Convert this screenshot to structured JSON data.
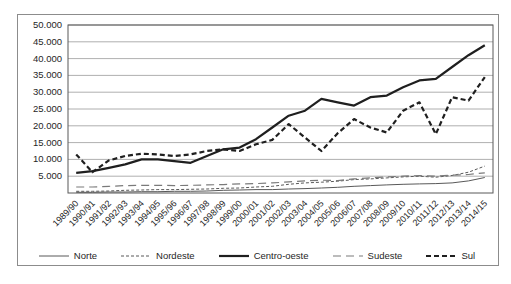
{
  "chart_data": {
    "type": "line",
    "title": "",
    "xlabel": "",
    "ylabel": "",
    "ylim": [
      0,
      50
    ],
    "grid": true,
    "legend_position": "bottom",
    "ytick_labels": [
      "50.000",
      "45.000",
      "40.000",
      "35.000",
      "30.000",
      "25.000",
      "20.000",
      "15.000",
      "10.000",
      "5.000"
    ],
    "ytick_values": [
      50,
      45,
      40,
      35,
      30,
      25,
      20,
      15,
      10,
      5
    ],
    "categories": [
      "1989/90",
      "1990/91",
      "1991/92",
      "1992/93",
      "1993/94",
      "1994/95",
      "1995/96",
      "1996/97",
      "1997/98",
      "1998/99",
      "1999/00",
      "2000/01",
      "2001/02",
      "2002/03",
      "2003/04",
      "2004/05",
      "2005/06",
      "2006/07",
      "2007/08",
      "2008/09",
      "2009/10",
      "2010/11",
      "2011/12",
      "2012/13",
      "2013/14",
      "2014/15"
    ],
    "series": [
      {
        "name": "Norte",
        "color": "#595959",
        "width": 1,
        "dash": "",
        "values": [
          0.2,
          0.2,
          0.3,
          0.3,
          0.4,
          0.4,
          0.5,
          0.5,
          0.6,
          0.8,
          0.9,
          1.0,
          1.0,
          1.2,
          1.3,
          1.5,
          1.7,
          2.0,
          2.2,
          2.4,
          2.6,
          2.7,
          2.8,
          3.0,
          3.6,
          4.6
        ]
      },
      {
        "name": "Nordeste",
        "color": "#595959",
        "width": 1,
        "dash": "3,2",
        "values": [
          0.5,
          0.5,
          0.6,
          0.8,
          0.9,
          1.0,
          1.0,
          1.1,
          1.2,
          1.4,
          1.5,
          1.8,
          2.0,
          2.6,
          3.0,
          3.2,
          3.5,
          4.0,
          4.2,
          4.5,
          4.8,
          5.0,
          4.7,
          5.2,
          6.2,
          8.0
        ]
      },
      {
        "name": "Centro-oeste",
        "color": "#1f1f1f",
        "width": 2.2,
        "dash": "",
        "values": [
          6.0,
          6.5,
          7.5,
          8.5,
          10.0,
          10.0,
          9.5,
          9.0,
          11.0,
          13.0,
          13.5,
          16.0,
          19.5,
          23.0,
          24.5,
          28.0,
          27.0,
          26.0,
          28.5,
          29.0,
          31.5,
          33.5,
          34.0,
          37.5,
          41.0,
          44.0
        ]
      },
      {
        "name": "Sudeste",
        "color": "#7a7a7a",
        "width": 1.2,
        "dash": "8,5",
        "values": [
          1.8,
          1.8,
          2.0,
          2.2,
          2.3,
          2.3,
          2.2,
          2.3,
          2.4,
          2.5,
          2.7,
          2.8,
          3.0,
          3.3,
          3.6,
          3.8,
          3.7,
          4.2,
          4.5,
          4.8,
          5.0,
          5.2,
          5.0,
          5.3,
          5.5,
          6.0
        ]
      },
      {
        "name": "Sul",
        "color": "#1f1f1f",
        "width": 2.2,
        "dash": "5,3",
        "values": [
          11.5,
          6.2,
          9.7,
          11.0,
          11.7,
          11.5,
          11.0,
          11.5,
          12.5,
          13.0,
          12.5,
          14.5,
          15.8,
          20.5,
          16.5,
          12.5,
          17.8,
          22.0,
          19.5,
          18.0,
          24.5,
          27.0,
          17.5,
          28.5,
          27.5,
          34.5
        ]
      }
    ]
  },
  "legend": {
    "items": [
      {
        "label": "Norte"
      },
      {
        "label": "Nordeste"
      },
      {
        "label": "Centro-oeste"
      },
      {
        "label": "Sudeste"
      },
      {
        "label": "Sul"
      }
    ]
  },
  "colors": {
    "background": "#ffffff",
    "frame": "#8c8c8c",
    "grid": "#9b9b9b",
    "axis": "#595959",
    "text": "#262626"
  }
}
